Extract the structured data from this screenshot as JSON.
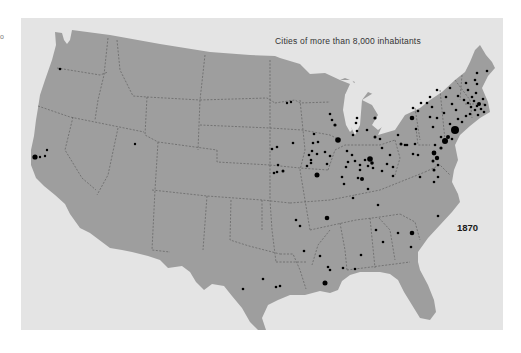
{
  "map": {
    "title": "Cities of more than 8,000 inhabitants",
    "year_label": "1870",
    "edge_mark": "o",
    "colors": {
      "background": "#ffffff",
      "panel": "#e4e4e4",
      "land": "#9e9e9e",
      "borders": "#555555",
      "cities": "#000000"
    },
    "city_markers": [
      {
        "x": 60,
        "y": 69,
        "r": 1.3
      },
      {
        "x": 35,
        "y": 157,
        "r": 2.6
      },
      {
        "x": 40,
        "y": 157,
        "r": 1.2
      },
      {
        "x": 45,
        "y": 156,
        "r": 1.2
      },
      {
        "x": 47,
        "y": 150,
        "r": 1.2
      },
      {
        "x": 135,
        "y": 144,
        "r": 1.2
      },
      {
        "x": 287,
        "y": 103,
        "r": 1.2
      },
      {
        "x": 291,
        "y": 102,
        "r": 1.2
      },
      {
        "x": 330,
        "y": 114,
        "r": 1.3
      },
      {
        "x": 332,
        "y": 120,
        "r": 1.3
      },
      {
        "x": 335,
        "y": 125,
        "r": 1.6
      },
      {
        "x": 338,
        "y": 140,
        "r": 2.8
      },
      {
        "x": 357,
        "y": 118,
        "r": 1.3
      },
      {
        "x": 356,
        "y": 123,
        "r": 1.3
      },
      {
        "x": 357,
        "y": 131,
        "r": 1.3
      },
      {
        "x": 367,
        "y": 130,
        "r": 1.3
      },
      {
        "x": 375,
        "y": 118,
        "r": 1.6
      },
      {
        "x": 375,
        "y": 137,
        "r": 1.5
      },
      {
        "x": 380,
        "y": 139,
        "r": 1.3
      },
      {
        "x": 353,
        "y": 135,
        "r": 1.3
      },
      {
        "x": 314,
        "y": 134,
        "r": 1.3
      },
      {
        "x": 313,
        "y": 143,
        "r": 1.3
      },
      {
        "x": 318,
        "y": 142,
        "r": 1.3
      },
      {
        "x": 293,
        "y": 143,
        "r": 1.3
      },
      {
        "x": 312,
        "y": 151,
        "r": 1.3
      },
      {
        "x": 317,
        "y": 154,
        "r": 1.3
      },
      {
        "x": 309,
        "y": 155,
        "r": 1.3
      },
      {
        "x": 325,
        "y": 152,
        "r": 1.3
      },
      {
        "x": 330,
        "y": 156,
        "r": 1.3
      },
      {
        "x": 327,
        "y": 164,
        "r": 1.3
      },
      {
        "x": 311,
        "y": 160,
        "r": 1.3
      },
      {
        "x": 307,
        "y": 166,
        "r": 1.3
      },
      {
        "x": 311,
        "y": 163,
        "r": 1.3
      },
      {
        "x": 277,
        "y": 147,
        "r": 1.3
      },
      {
        "x": 272,
        "y": 149,
        "r": 1.3
      },
      {
        "x": 278,
        "y": 165,
        "r": 1.3
      },
      {
        "x": 277,
        "y": 172,
        "r": 1.3
      },
      {
        "x": 283,
        "y": 171,
        "r": 1.5
      },
      {
        "x": 274,
        "y": 173,
        "r": 1.3
      },
      {
        "x": 317,
        "y": 175,
        "r": 2.5
      },
      {
        "x": 347,
        "y": 151,
        "r": 1.3
      },
      {
        "x": 352,
        "y": 155,
        "r": 1.3
      },
      {
        "x": 348,
        "y": 162,
        "r": 1.3
      },
      {
        "x": 355,
        "y": 161,
        "r": 1.3
      },
      {
        "x": 346,
        "y": 167,
        "r": 1.3
      },
      {
        "x": 360,
        "y": 165,
        "r": 1.3
      },
      {
        "x": 365,
        "y": 160,
        "r": 1.3
      },
      {
        "x": 370,
        "y": 159,
        "r": 2.8
      },
      {
        "x": 372,
        "y": 163,
        "r": 1.8
      },
      {
        "x": 368,
        "y": 166,
        "r": 1.3
      },
      {
        "x": 373,
        "y": 168,
        "r": 1.3
      },
      {
        "x": 360,
        "y": 170,
        "r": 1.3
      },
      {
        "x": 342,
        "y": 177,
        "r": 1.3
      },
      {
        "x": 358,
        "y": 178,
        "r": 1.3
      },
      {
        "x": 362,
        "y": 179,
        "r": 2
      },
      {
        "x": 382,
        "y": 148,
        "r": 1.3
      },
      {
        "x": 390,
        "y": 155,
        "r": 1.3
      },
      {
        "x": 387,
        "y": 164,
        "r": 1.3
      },
      {
        "x": 393,
        "y": 167,
        "r": 1.3
      },
      {
        "x": 382,
        "y": 171,
        "r": 1.3
      },
      {
        "x": 398,
        "y": 135,
        "r": 1.3
      },
      {
        "x": 401,
        "y": 144,
        "r": 1.5
      },
      {
        "x": 405,
        "y": 145,
        "r": 1.3
      },
      {
        "x": 407,
        "y": 145,
        "r": 1.3
      },
      {
        "x": 415,
        "y": 144,
        "r": 1.3
      },
      {
        "x": 413,
        "y": 154,
        "r": 1.3
      },
      {
        "x": 418,
        "y": 155,
        "r": 1.3
      },
      {
        "x": 416,
        "y": 129,
        "r": 1.3
      },
      {
        "x": 412,
        "y": 118,
        "r": 2.3
      },
      {
        "x": 418,
        "y": 111,
        "r": 1.3
      },
      {
        "x": 421,
        "y": 103,
        "r": 1.3
      },
      {
        "x": 432,
        "y": 107,
        "r": 1.3
      },
      {
        "x": 430,
        "y": 117,
        "r": 1.3
      },
      {
        "x": 437,
        "y": 118,
        "r": 1.3
      },
      {
        "x": 433,
        "y": 127,
        "r": 1.3
      },
      {
        "x": 441,
        "y": 137,
        "r": 1.3
      },
      {
        "x": 435,
        "y": 145,
        "r": 1.3
      },
      {
        "x": 434,
        "y": 153,
        "r": 2.4
      },
      {
        "x": 437,
        "y": 158,
        "r": 2.2
      },
      {
        "x": 433,
        "y": 161,
        "r": 1.5
      },
      {
        "x": 438,
        "y": 165,
        "r": 1.3
      },
      {
        "x": 434,
        "y": 170,
        "r": 1.5
      },
      {
        "x": 445,
        "y": 141,
        "r": 3
      },
      {
        "x": 448,
        "y": 137,
        "r": 2
      },
      {
        "x": 441,
        "y": 148,
        "r": 1.6
      },
      {
        "x": 452,
        "y": 139,
        "r": 1.3
      },
      {
        "x": 455,
        "y": 130,
        "r": 4
      },
      {
        "x": 450,
        "y": 124,
        "r": 1.3
      },
      {
        "x": 458,
        "y": 119,
        "r": 1.3
      },
      {
        "x": 462,
        "y": 122,
        "r": 1.3
      },
      {
        "x": 444,
        "y": 113,
        "r": 1.3
      },
      {
        "x": 452,
        "y": 104,
        "r": 1.3
      },
      {
        "x": 456,
        "y": 110,
        "r": 1.3
      },
      {
        "x": 466,
        "y": 116,
        "r": 1.3
      },
      {
        "x": 470,
        "y": 114,
        "r": 1.3
      },
      {
        "x": 446,
        "y": 97,
        "r": 1.3
      },
      {
        "x": 450,
        "y": 88,
        "r": 1.3
      },
      {
        "x": 458,
        "y": 96,
        "r": 1.3
      },
      {
        "x": 464,
        "y": 100,
        "r": 1.3
      },
      {
        "x": 468,
        "y": 103,
        "r": 1.3
      },
      {
        "x": 471,
        "y": 107,
        "r": 1.3
      },
      {
        "x": 474,
        "y": 101,
        "r": 1.3
      },
      {
        "x": 477,
        "y": 106,
        "r": 1.3
      },
      {
        "x": 475,
        "y": 110,
        "r": 1.3
      },
      {
        "x": 479,
        "y": 104,
        "r": 2
      },
      {
        "x": 481,
        "y": 109,
        "r": 1.3
      },
      {
        "x": 478,
        "y": 115,
        "r": 1.3
      },
      {
        "x": 472,
        "y": 97,
        "r": 1.3
      },
      {
        "x": 468,
        "y": 90,
        "r": 1.3
      },
      {
        "x": 466,
        "y": 83,
        "r": 1.3
      },
      {
        "x": 477,
        "y": 84,
        "r": 1.3
      },
      {
        "x": 476,
        "y": 93,
        "r": 1.3
      },
      {
        "x": 483,
        "y": 99,
        "r": 1.3
      },
      {
        "x": 485,
        "y": 105,
        "r": 1.3
      },
      {
        "x": 484,
        "y": 112,
        "r": 1.3
      },
      {
        "x": 477,
        "y": 73,
        "r": 1.3
      },
      {
        "x": 475,
        "y": 80,
        "r": 1.3
      },
      {
        "x": 487,
        "y": 71,
        "r": 1.3
      },
      {
        "x": 437,
        "y": 90,
        "r": 1.3
      },
      {
        "x": 430,
        "y": 97,
        "r": 1.3
      },
      {
        "x": 427,
        "y": 103,
        "r": 1.3
      },
      {
        "x": 413,
        "y": 108,
        "r": 1.3
      },
      {
        "x": 438,
        "y": 177,
        "r": 1.3
      },
      {
        "x": 434,
        "y": 182,
        "r": 1.3
      },
      {
        "x": 420,
        "y": 177,
        "r": 1.3
      },
      {
        "x": 393,
        "y": 176,
        "r": 1.3
      },
      {
        "x": 344,
        "y": 184,
        "r": 1.3
      },
      {
        "x": 368,
        "y": 189,
        "r": 1.3
      },
      {
        "x": 353,
        "y": 198,
        "r": 1.3
      },
      {
        "x": 327,
        "y": 218,
        "r": 2.3
      },
      {
        "x": 300,
        "y": 226,
        "r": 1.3
      },
      {
        "x": 378,
        "y": 205,
        "r": 1.3
      },
      {
        "x": 376,
        "y": 230,
        "r": 1.3
      },
      {
        "x": 398,
        "y": 233,
        "r": 1.3
      },
      {
        "x": 383,
        "y": 242,
        "r": 1.3
      },
      {
        "x": 438,
        "y": 216,
        "r": 1.3
      },
      {
        "x": 412,
        "y": 233,
        "r": 2.3
      },
      {
        "x": 411,
        "y": 247,
        "r": 1.3
      },
      {
        "x": 361,
        "y": 255,
        "r": 1.3
      },
      {
        "x": 320,
        "y": 256,
        "r": 1.3
      },
      {
        "x": 343,
        "y": 268,
        "r": 1.3
      },
      {
        "x": 325,
        "y": 283,
        "r": 2.5
      },
      {
        "x": 355,
        "y": 269,
        "r": 1.3
      },
      {
        "x": 263,
        "y": 279,
        "r": 1.3
      },
      {
        "x": 276,
        "y": 287,
        "r": 1.3
      },
      {
        "x": 280,
        "y": 286,
        "r": 1.3
      },
      {
        "x": 243,
        "y": 289,
        "r": 1.3
      },
      {
        "x": 296,
        "y": 220,
        "r": 1.3
      },
      {
        "x": 304,
        "y": 251,
        "r": 1.3
      },
      {
        "x": 328,
        "y": 267,
        "r": 1.3
      },
      {
        "x": 330,
        "y": 270,
        "r": 1.3
      }
    ]
  }
}
